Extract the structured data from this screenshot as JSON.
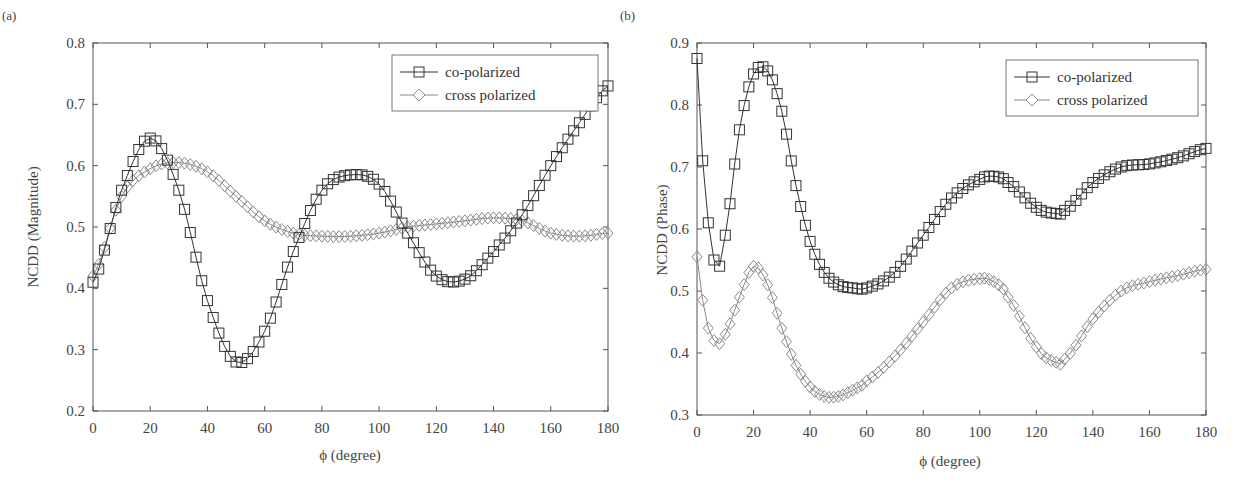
{
  "chart_data": [
    {
      "panel": "(a)",
      "type": "line",
      "title": "",
      "xlabel": "ϕ (degree)",
      "ylabel": "NCDD (Magnitude)",
      "xlim": [
        0,
        180
      ],
      "ylim": [
        0.2,
        0.8
      ],
      "xticks": [
        0,
        20,
        40,
        60,
        80,
        100,
        120,
        140,
        160,
        180
      ],
      "yticks": [
        0.2,
        0.3,
        0.4,
        0.5,
        0.6,
        0.7,
        0.8
      ],
      "grid": false,
      "legend_position": "top-right",
      "x": [
        0,
        10,
        20,
        30,
        40,
        50,
        60,
        70,
        80,
        90,
        100,
        110,
        120,
        130,
        140,
        150,
        160,
        170,
        180
      ],
      "series": [
        {
          "name": "co-polarized",
          "marker": "square",
          "color": "#333333",
          "values": [
            0.41,
            0.56,
            0.645,
            0.56,
            0.38,
            0.28,
            0.33,
            0.46,
            0.56,
            0.585,
            0.57,
            0.49,
            0.42,
            0.415,
            0.46,
            0.52,
            0.6,
            0.67,
            0.73
          ]
        },
        {
          "name": "cross polarized",
          "marker": "diamond",
          "color": "#8a8a8a",
          "values": [
            0.42,
            0.55,
            0.595,
            0.605,
            0.59,
            0.55,
            0.51,
            0.49,
            0.485,
            0.485,
            0.49,
            0.5,
            0.505,
            0.51,
            0.515,
            0.51,
            0.49,
            0.485,
            0.49
          ]
        }
      ]
    },
    {
      "panel": "(b)",
      "type": "line",
      "title": "",
      "xlabel": "ϕ (degree)",
      "ylabel": "NCDD (Phase)",
      "xlim": [
        0,
        180
      ],
      "ylim": [
        0.3,
        0.9
      ],
      "xticks": [
        0,
        20,
        40,
        60,
        80,
        100,
        120,
        140,
        160,
        180
      ],
      "yticks": [
        0.3,
        0.4,
        0.5,
        0.6,
        0.7,
        0.8,
        0.9
      ],
      "grid": false,
      "legend_position": "top-right",
      "x": [
        0,
        2,
        4,
        6,
        8,
        10,
        15,
        20,
        25,
        30,
        35,
        40,
        45,
        50,
        55,
        60,
        70,
        80,
        90,
        100,
        105,
        110,
        120,
        127,
        130,
        140,
        150,
        160,
        170,
        180
      ],
      "series": [
        {
          "name": "co-polarized",
          "marker": "square",
          "color": "#333333",
          "values": [
            0.875,
            0.71,
            0.61,
            0.55,
            0.54,
            0.59,
            0.76,
            0.85,
            0.855,
            0.79,
            0.67,
            0.58,
            0.53,
            0.51,
            0.505,
            0.505,
            0.53,
            0.59,
            0.65,
            0.68,
            0.685,
            0.675,
            0.635,
            0.625,
            0.63,
            0.675,
            0.7,
            0.705,
            0.715,
            0.73
          ]
        },
        {
          "name": "cross polarized",
          "marker": "diamond",
          "color": "#8a8a8a",
          "values": [
            0.555,
            0.485,
            0.44,
            0.42,
            0.415,
            0.43,
            0.49,
            0.54,
            0.51,
            0.44,
            0.38,
            0.345,
            0.33,
            0.33,
            0.34,
            0.355,
            0.395,
            0.45,
            0.505,
            0.52,
            0.515,
            0.49,
            0.41,
            0.385,
            0.39,
            0.455,
            0.5,
            0.515,
            0.525,
            0.535
          ]
        }
      ]
    }
  ],
  "panels": {
    "a": {
      "label": "(a)",
      "ylabel": "NCDD (Magnitude)",
      "xlabel": "ϕ (degree)",
      "legend": [
        "co-polarized",
        "cross polarized"
      ]
    },
    "b": {
      "label": "(b)",
      "ylabel": "NCDD (Phase)",
      "xlabel": "ϕ (degree)",
      "legend": [
        "co-polarized",
        "cross polarized"
      ]
    }
  }
}
